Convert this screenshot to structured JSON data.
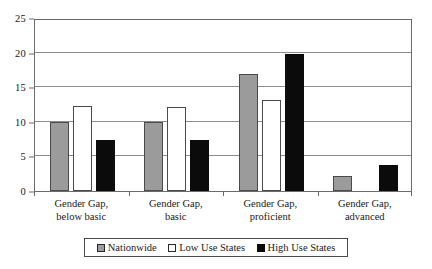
{
  "chart_data": {
    "type": "bar",
    "title": "",
    "subtitle": "",
    "xlabel": "",
    "ylabel": "",
    "ylim": [
      0,
      25
    ],
    "yticks": [
      0,
      5,
      10,
      15,
      20,
      25
    ],
    "ytick_labels": [
      "0",
      "5",
      "10",
      "15",
      "20",
      "25"
    ],
    "grid": "horizontal",
    "legend_position": "bottom",
    "categories": [
      "Gender Gap, below basic",
      "Gender Gap, basic",
      "Gender Gap, proficient",
      "Gender Gap, advanced"
    ],
    "category_lines": [
      [
        "Gender Gap,",
        "below basic"
      ],
      [
        "Gender Gap,",
        "basic"
      ],
      [
        "Gender Gap,",
        "proficient"
      ],
      [
        "Gender Gap,",
        "advanced"
      ]
    ],
    "series": [
      {
        "name": "Nationwide",
        "color": "#9b9b9b",
        "values": [
          10.0,
          10.0,
          16.9,
          2.2
        ]
      },
      {
        "name": "Low Use States",
        "color": "#ffffff",
        "values": [
          12.3,
          12.2,
          13.2,
          0.0
        ]
      },
      {
        "name": "High Use States",
        "color": "#0b0b0b",
        "values": [
          7.4,
          7.4,
          19.8,
          3.8
        ]
      }
    ]
  },
  "legend": {
    "items": [
      {
        "label": "Nationwide",
        "swatch": "gray-square-swatch"
      },
      {
        "label": "Low Use States",
        "swatch": "white-square-swatch"
      },
      {
        "label": "High Use States",
        "swatch": "black-square-swatch"
      }
    ]
  },
  "axes": {
    "y_labels": [
      "25",
      "20",
      "15",
      "10",
      "5",
      "0"
    ]
  },
  "colors": {
    "nationwide": "#9b9b9b",
    "low_use_states": "#ffffff",
    "high_use_states": "#0b0b0b",
    "frame": "#6b6b6b",
    "gridline": "#8d8d8d",
    "background": "#ffffff",
    "text": "#1a1a1a"
  }
}
